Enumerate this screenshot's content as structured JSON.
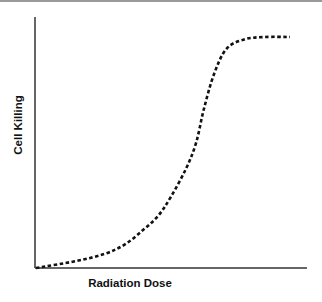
{
  "chart_data": {
    "type": "line",
    "title": "",
    "xlabel": "Radiation Dose",
    "ylabel": "Cell Killing",
    "grid": false,
    "legend": null,
    "ticks": "none",
    "line_style": "dashed",
    "line_color": "#111111",
    "x": [
      0,
      0.16,
      0.27,
      0.35,
      0.42,
      0.48,
      0.53,
      0.59,
      0.63,
      0.66,
      0.7,
      0.75,
      0.82,
      0.9,
      1.0
    ],
    "y": [
      0,
      0.03,
      0.06,
      0.1,
      0.16,
      0.22,
      0.3,
      0.42,
      0.53,
      0.67,
      0.82,
      0.93,
      0.97,
      0.98,
      0.98
    ],
    "xlim": [
      0,
      1.0
    ],
    "ylim": [
      0,
      1.08
    ]
  }
}
